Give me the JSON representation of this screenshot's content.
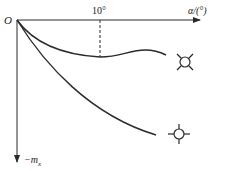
{
  "diagram": {
    "origin_label": "O",
    "x_axis_label": "α/(°)",
    "y_axis_label": "−m",
    "y_axis_subscript": "x",
    "tick_label": "10°",
    "curves": [
      {
        "name": "upper-curve",
        "symbol": "x-cross-circle-icon",
        "description": "decreases to minimum near 10°, then levels off"
      },
      {
        "name": "lower-curve",
        "symbol": "plus-cross-circle-icon",
        "description": "monotonically decreasing"
      }
    ],
    "colors": {
      "line": "#2a2a2a",
      "background": "#ffffff"
    }
  }
}
